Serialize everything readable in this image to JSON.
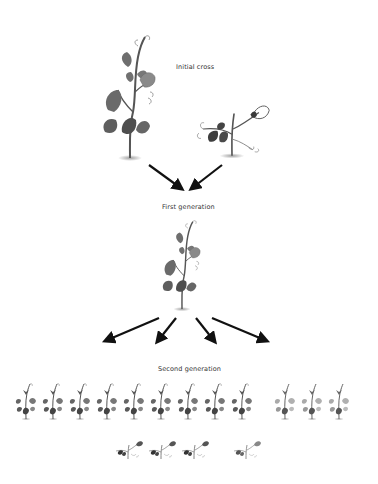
{
  "diagram": {
    "type": "genetics-cross",
    "stages": [
      {
        "id": "initial",
        "label": "Initial cross",
        "plants": [
          "tall-purple-parent",
          "short-dark-parent"
        ]
      },
      {
        "id": "f1",
        "label": "First generation",
        "plants": [
          "tall-purple-hybrid"
        ]
      },
      {
        "id": "f2",
        "label": "Second generation",
        "rows": [
          {
            "groups": [
              {
                "variant": "tall-dark",
                "count": 9
              },
              {
                "variant": "tall-light",
                "count": 3
              }
            ]
          },
          {
            "groups": [
              {
                "variant": "short-dark",
                "count": 3
              },
              {
                "variant": "short-light",
                "count": 1
              }
            ]
          }
        ]
      }
    ],
    "arrows": {
      "to_first_generation": 2,
      "to_second_generation": 4
    },
    "colors": {
      "background": "#ffffff",
      "arrow": "#111111",
      "label": "#333333",
      "plant_dark": "#4a4a4a",
      "plant_mid": "#7a7a7a",
      "plant_light": "#a8a8a8"
    }
  },
  "labels": {
    "initial": "Initial cross",
    "first": "First generation",
    "second": "Second generation"
  }
}
